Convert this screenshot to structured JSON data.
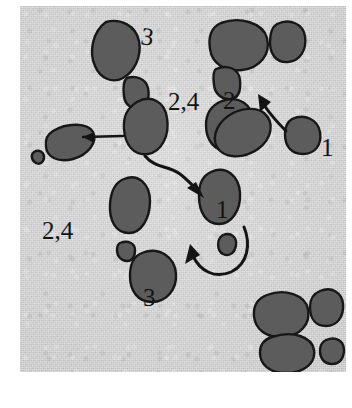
{
  "figure": {
    "plate": {
      "background_color": "#d2d2d2",
      "page_color": "#ffffff",
      "blob_fill_color": "#5c5c5c",
      "ink_color": "#141414",
      "width": 326,
      "height": 366
    }
  },
  "annotations": [
    {
      "id": "label-3-top",
      "text": "3",
      "x": 120,
      "y": 38,
      "rotation": 8
    },
    {
      "id": "label-24-upper",
      "text": "2,4",
      "x": 148,
      "y": 104,
      "rotation": 0
    },
    {
      "id": "label-2-right",
      "text": "2",
      "x": 203,
      "y": 103,
      "rotation": 0
    },
    {
      "id": "label-1-right",
      "text": "1",
      "x": 306,
      "y": 146,
      "rotation": 0
    },
    {
      "id": "label-1-center",
      "text": "1",
      "x": 216,
      "y": 208,
      "rotation": 0
    },
    {
      "id": "label-24-lower",
      "text": "2,4",
      "x": 42,
      "y": 231,
      "rotation": 0
    },
    {
      "id": "label-3-bottom",
      "text": "3",
      "x": 135,
      "y": 296,
      "rotation": 0
    }
  ],
  "blobs": [
    {
      "id": "blob-top-left-large",
      "region": "top-left",
      "label": "3"
    },
    {
      "id": "blob-top-left-small",
      "region": "top-left",
      "label": ""
    },
    {
      "id": "blob-upper-mid",
      "region": "upper-middle",
      "label": "2,4"
    },
    {
      "id": "blob-left-ellipse",
      "region": "left",
      "label": ""
    },
    {
      "id": "blob-left-dot",
      "region": "left",
      "label": ""
    },
    {
      "id": "blob-top-right-large",
      "region": "top-right",
      "label": ""
    },
    {
      "id": "blob-top-right-small",
      "region": "top-right",
      "label": ""
    },
    {
      "id": "blob-right-cap",
      "region": "top-right",
      "label": ""
    },
    {
      "id": "blob-overlap-upper",
      "region": "right",
      "label": "2"
    },
    {
      "id": "blob-overlap-lower",
      "region": "right",
      "label": "2"
    },
    {
      "id": "blob-right-d",
      "region": "right",
      "label": "1"
    },
    {
      "id": "blob-center",
      "region": "center",
      "label": "1"
    },
    {
      "id": "blob-center-dot",
      "region": "center",
      "label": ""
    },
    {
      "id": "blob-lower-left-oval",
      "region": "lower-left",
      "label": ""
    },
    {
      "id": "blob-lower-left-chip",
      "region": "lower-left",
      "label": ""
    },
    {
      "id": "blob-lower-mid",
      "region": "lower-middle",
      "label": "3"
    },
    {
      "id": "blob-bottom-right-a",
      "region": "bottom-right",
      "label": ""
    },
    {
      "id": "blob-bottom-right-b",
      "region": "bottom-right",
      "label": ""
    },
    {
      "id": "blob-bottom-right-c",
      "region": "bottom-right",
      "label": ""
    },
    {
      "id": "blob-bottom-right-d",
      "region": "bottom-right",
      "label": ""
    }
  ],
  "arrows": [
    {
      "id": "arrow-s-curve",
      "from": "blob-upper-mid",
      "to": "blob-center",
      "shape": "s-curve-down-right"
    },
    {
      "id": "arrow-u-curve",
      "from": "blob-center-dot",
      "to": "blob-lower-mid",
      "shape": "u-curve-up-left"
    },
    {
      "id": "arrow-right-up",
      "from": "blob-right-d",
      "to": "blob-overlap-upper",
      "shape": "curve-up-left"
    },
    {
      "id": "leader-left",
      "from": "blob-upper-mid",
      "to": "blob-left-ellipse",
      "shape": "straight-leader"
    }
  ]
}
